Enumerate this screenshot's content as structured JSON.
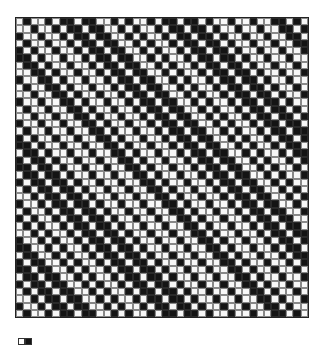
{
  "pattern": {
    "type": "weave-draft-grid",
    "columns": 40,
    "rows": 41,
    "encoding": {
      "0": "white",
      "1": "black"
    },
    "base_row": "0100101101100101001011011010010010011010",
    "shift_per_row": 1,
    "colors": {
      "black": "#141414",
      "white": "#f7f7f7",
      "gridline": "#888888"
    }
  },
  "legend": {
    "swatches": [
      {
        "name": "white-swatch",
        "color": "#ffffff"
      },
      {
        "name": "black-swatch",
        "color": "#141414"
      }
    ]
  }
}
